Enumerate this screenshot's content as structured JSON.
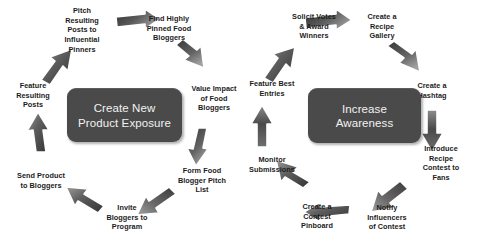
{
  "diagram": {
    "colors": {
      "hub_fill": "#4a4a4a",
      "hub_text": "#f2f2f2",
      "arrow_dark": "#3d3d3d",
      "arrow_light": "#8f8f8f",
      "arrow_outline": "#ffffff",
      "label_text": "#1c1c1c",
      "background": "#ffffff"
    },
    "cycles": [
      {
        "id": "create-new-product-exposure",
        "hub": "Create New\nProduct Exposure",
        "direction": "clockwise",
        "nodes": [
          {
            "id": "pitch-resulting-posts",
            "label": "Pitch\nResulting\nPosts to\nInfluential\nPinners"
          },
          {
            "id": "find-highly-pinned",
            "label": "Find Highly\nPinned Food\nBloggers"
          },
          {
            "id": "value-impact",
            "label": "Value Impact\nof Food\nBloggers"
          },
          {
            "id": "form-pitch-list",
            "label": "Form Food\nBlogger Pitch\nList"
          },
          {
            "id": "invite-bloggers",
            "label": "Invite\nBloggers to\nProgram"
          },
          {
            "id": "send-product",
            "label": "Send Product\nto Bloggers"
          },
          {
            "id": "feature-resulting-posts",
            "label": "Feature\nResulting\nPosts"
          }
        ]
      },
      {
        "id": "increase-awareness",
        "hub": "Increase\nAwareness",
        "direction": "clockwise",
        "nodes": [
          {
            "id": "solicit-votes",
            "label": "Solicit Votes\n& Award\nWinners"
          },
          {
            "id": "create-recipe-gallery",
            "label": "Create a\nRecipe\nGallery"
          },
          {
            "id": "create-hashtag",
            "label": "Create a\nHashtag"
          },
          {
            "id": "introduce-contest",
            "label": "Introduce\nRecipe\nContest to\nFans"
          },
          {
            "id": "notify-influencers",
            "label": "Notify\nInfluencers\nof Contest"
          },
          {
            "id": "create-contest-pinboard",
            "label": "Create a\nContest\nPinboard"
          },
          {
            "id": "monitor-submissions",
            "label": "Monitor\nSubmissions"
          },
          {
            "id": "feature-best-entries",
            "label": "Feature Best\nEntries"
          }
        ]
      }
    ]
  }
}
